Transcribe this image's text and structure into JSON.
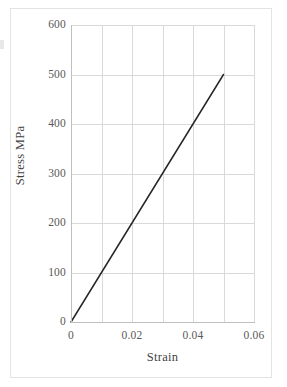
{
  "chart_data": {
    "type": "line",
    "title": "",
    "xlabel": "Strain",
    "ylabel": "Stress MPa",
    "xlim": [
      0,
      0.06
    ],
    "ylim": [
      0,
      600
    ],
    "grid": true,
    "legend": false,
    "legend_position": "none",
    "x_ticks": [
      0,
      0.02,
      0.04,
      0.06
    ],
    "x_tick_labels": [
      "0",
      "0.02",
      "0.04",
      "0.06"
    ],
    "x_gridlines": [
      0,
      0.01,
      0.02,
      0.03,
      0.04,
      0.05,
      0.06
    ],
    "y_ticks": [
      0,
      100,
      200,
      300,
      400,
      500,
      600
    ],
    "y_tick_labels": [
      "0",
      "100",
      "200",
      "300",
      "400",
      "500",
      "600"
    ],
    "y_gridlines": [
      0,
      100,
      200,
      300,
      400,
      500,
      600
    ],
    "series": [
      {
        "name": "Stress-strain",
        "color": "#262626",
        "line_width": 1.5,
        "x": [
          0,
          0.05
        ],
        "y": [
          0,
          500
        ],
        "points": [
          [
            0,
            0
          ],
          [
            0.01,
            100
          ],
          [
            0.02,
            200
          ],
          [
            0.03,
            300
          ],
          [
            0.04,
            400
          ],
          [
            0.05,
            500
          ]
        ]
      }
    ],
    "annotations": []
  },
  "style": {
    "background": "#ffffff",
    "frame_color": "#e3e3e3",
    "grid_color": "#d9d9d9",
    "axis_color": "#bfbfbf",
    "tick_label_color": "#595959",
    "axis_title_color": "#3f3f3f"
  }
}
